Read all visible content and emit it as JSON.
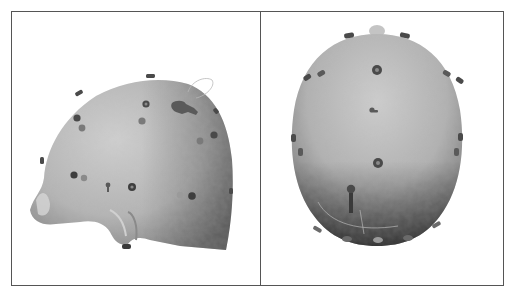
{
  "figure": {
    "panels": [
      {
        "id": "left",
        "view": "lateral-oblique view of head scan with electrodes"
      },
      {
        "id": "right",
        "view": "top-down view of head scan with electrodes"
      }
    ],
    "colors": {
      "border": "#555555",
      "background": "#ffffff",
      "skin_light": "#c9c9c9",
      "skin_mid": "#a9a9a9",
      "skin_dark": "#5e5e5e",
      "electrode": "#4a4a4a",
      "electrode_light": "#8a8a8a",
      "wire": "#b0b0b0"
    },
    "electrodes_left_count": 22,
    "electrodes_right_count": 21
  }
}
